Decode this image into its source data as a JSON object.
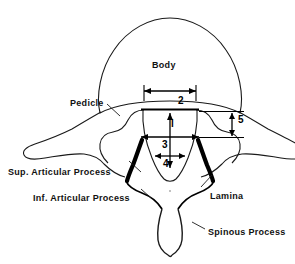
{
  "figure": {
    "background_color": "#ffffff",
    "line_color": "#1a1a1a",
    "bold_line_color": "#000000"
  },
  "labels": {
    "body": "Body",
    "pedicle": "Pedicle",
    "superior_articular_process": "Sup. Articular Process",
    "inferior_articular_process": "Inf. Articular Process",
    "lamina": "Lamina",
    "spinous_process": "Spinous Process"
  },
  "dimensions": {
    "d1": "l",
    "d2": "2",
    "d3": "3",
    "d4": "4",
    "d5": "5"
  }
}
